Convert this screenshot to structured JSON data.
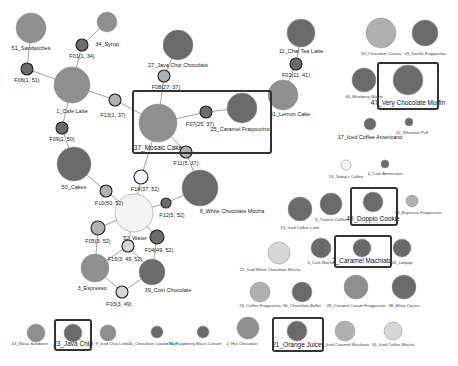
{
  "diagram": {
    "type": "item-association-network",
    "colors": {
      "dark": "#6b6b6b",
      "mid": "#8f8f8f",
      "light": "#b0b0b0",
      "pale": "#d6d6d6",
      "white": "#f4f4f4",
      "edge": "#8a8a8a",
      "highlight_border": "#333333"
    },
    "items": [
      {
        "id": "51",
        "label": "51_Sandwiches",
        "x": 31,
        "y": 28,
        "r": 15,
        "fill": "mid",
        "lx": 31,
        "ly": 50,
        "cls": "lbl"
      },
      {
        "id": "34",
        "label": "34_Syrup",
        "x": 107,
        "y": 22,
        "r": 10,
        "fill": "mid",
        "lx": 107,
        "ly": 46,
        "cls": "lbl"
      },
      {
        "id": "1",
        "label": "1_Cafe Latte",
        "x": 72,
        "y": 85,
        "r": 18,
        "fill": "mid",
        "lx": 72,
        "ly": 113,
        "cls": "lbl"
      },
      {
        "id": "27",
        "label": "27_Java Chip Chocolate",
        "x": 178,
        "y": 45,
        "r": 15,
        "fill": "dark",
        "lx": 178,
        "ly": 67,
        "cls": "lbl"
      },
      {
        "id": "11",
        "label": "11_Chai Tea Latte",
        "x": 301,
        "y": 33,
        "r": 14,
        "fill": "dark",
        "lx": 301,
        "ly": 53,
        "cls": "lbl"
      },
      {
        "id": "41",
        "label": "41_Lemon Cake",
        "x": 283,
        "y": 95,
        "r": 15,
        "fill": "mid",
        "lx": 290,
        "ly": 116,
        "cls": "lbl"
      },
      {
        "id": "37",
        "label": "37_Mosaic Cake",
        "x": 158,
        "y": 123,
        "r": 19,
        "fill": "mid",
        "lx": 158,
        "ly": 150,
        "cls": "lbl-hl"
      },
      {
        "id": "25",
        "label": "25_Caramel Frappucino",
        "x": 242,
        "y": 108,
        "r": 15,
        "fill": "dark",
        "lx": 240,
        "ly": 131,
        "cls": "lbl"
      },
      {
        "id": "50",
        "label": "50_Cakes",
        "x": 74,
        "y": 164,
        "r": 17,
        "fill": "dark",
        "lx": 74,
        "ly": 189,
        "cls": "lbl"
      },
      {
        "id": "6",
        "label": "6_White Chocolate Mocha",
        "x": 200,
        "y": 188,
        "r": 18,
        "fill": "dark",
        "lx": 232,
        "ly": 213,
        "cls": "lbl"
      },
      {
        "id": "52",
        "label": "52_Water",
        "x": 134,
        "y": 213,
        "r": 19,
        "fill": "white",
        "lx": 135,
        "ly": 240,
        "cls": "lbl"
      },
      {
        "id": "3",
        "label": "3_Espresso",
        "x": 95,
        "y": 268,
        "r": 14,
        "fill": "mid",
        "lx": 92,
        "ly": 290,
        "cls": "lbl"
      },
      {
        "id": "39",
        "label": "39_Coin Chocolate",
        "x": 152,
        "y": 272,
        "r": 13,
        "fill": "dark",
        "lx": 168,
        "ly": 292,
        "cls": "lbl"
      },
      {
        "id": "35",
        "label": "35_Chocolate Cosica",
        "x": 381,
        "y": 33,
        "r": 15,
        "fill": "light",
        "lx": 381,
        "ly": 55,
        "cls": "lbl-sm"
      },
      {
        "id": "29",
        "label": "29_Vanilla Frappucino",
        "x": 425,
        "y": 33,
        "r": 13,
        "fill": "dark",
        "lx": 425,
        "ly": 55,
        "cls": "lbl-sm"
      },
      {
        "id": "46",
        "label": "46_Blueberry Muffin",
        "x": 364,
        "y": 80,
        "r": 12,
        "fill": "dark",
        "lx": 364,
        "ly": 98,
        "cls": "lbl-sm"
      },
      {
        "id": "47",
        "label": "47_Very Chocolate Muffin",
        "x": 408,
        "y": 80,
        "r": 15,
        "fill": "dark",
        "lx": 408,
        "ly": 105,
        "cls": "lbl-hl"
      },
      {
        "id": "17",
        "label": "17_Iced Coffee Americano",
        "x": 370,
        "y": 124,
        "r": 6,
        "fill": "dark",
        "lx": 370,
        "ly": 139,
        "cls": "lbl"
      },
      {
        "id": "42",
        "label": "42_Wheaten Puff",
        "x": 409,
        "y": 122,
        "r": 4,
        "fill": "dark",
        "lx": 412,
        "ly": 134,
        "cls": "lbl-sm"
      },
      {
        "id": "13",
        "label": "13_Today's Coffee",
        "x": 346,
        "y": 165,
        "r": 5,
        "fill": "white",
        "lx": 346,
        "ly": 178,
        "cls": "lbl-sm"
      },
      {
        "id": "4",
        "label": "4_Cafe Americano",
        "x": 385,
        "y": 164,
        "r": 4,
        "fill": "dark",
        "lx": 385,
        "ly": 175,
        "cls": "lbl-sm"
      },
      {
        "id": "15",
        "label": "15_Iced Coffee Latte",
        "x": 300,
        "y": 209,
        "r": 12,
        "fill": "dark",
        "lx": 300,
        "ly": 229,
        "cls": "lbl-sm"
      },
      {
        "id": "8",
        "label": "8_Turkish Coffee",
        "x": 331,
        "y": 204,
        "r": 11,
        "fill": "dark",
        "lx": 331,
        "ly": 221,
        "cls": "lbl-sm"
      },
      {
        "id": "40",
        "label": "40_Doppio Cookie",
        "x": 373,
        "y": 202,
        "r": 10,
        "fill": "dark",
        "lx": 373,
        "ly": 221,
        "cls": "lbl-hl"
      },
      {
        "id": "24",
        "label": "24_Espresso Frappucino",
        "x": 412,
        "y": 201,
        "r": 6,
        "fill": "light",
        "lx": 418,
        "ly": 214,
        "cls": "lbl-sm"
      },
      {
        "id": "22",
        "label": "22_Iced White Chocolate Mocha",
        "x": 279,
        "y": 253,
        "r": 11,
        "fill": "pale",
        "lx": 270,
        "ly": 271,
        "cls": "lbl-sm"
      },
      {
        "id": "6b",
        "label": "6_Cafe Mocha",
        "x": 321,
        "y": 248,
        "r": 10,
        "fill": "dark",
        "lx": 321,
        "ly": 264,
        "cls": "lbl-sm"
      },
      {
        "id": "7",
        "label": "7_Caramel Machiato",
        "x": 362,
        "y": 248,
        "r": 9,
        "fill": "dark",
        "lx": 362,
        "ly": 263,
        "cls": "lbl-hl"
      },
      {
        "id": "45",
        "label": "45_Lolipop",
        "x": 402,
        "y": 248,
        "r": 9,
        "fill": "dark",
        "lx": 402,
        "ly": 264,
        "cls": "lbl-sm"
      },
      {
        "id": "26",
        "label": "26_Coffee Frappucino",
        "x": 260,
        "y": 292,
        "r": 10,
        "fill": "light",
        "lx": 260,
        "ly": 307,
        "cls": "lbl-sm"
      },
      {
        "id": "36",
        "label": "36_Chocolate Bellini",
        "x": 302,
        "y": 292,
        "r": 10,
        "fill": "dark",
        "lx": 302,
        "ly": 307,
        "cls": "lbl-sm"
      },
      {
        "id": "28",
        "label": "28_Caramel Cream Frappucino",
        "x": 356,
        "y": 287,
        "r": 12,
        "fill": "mid",
        "lx": 356,
        "ly": 307,
        "cls": "lbl-sm"
      },
      {
        "id": "38",
        "label": "38_Misto Cocios",
        "x": 404,
        "y": 287,
        "r": 12,
        "fill": "dark",
        "lx": 404,
        "ly": 307,
        "cls": "lbl-sm"
      },
      {
        "id": "43",
        "label": "43_Wasa Sandwich",
        "x": 36,
        "y": 333,
        "r": 9,
        "fill": "mid",
        "lx": 30,
        "ly": 345,
        "cls": "lbl-sm"
      },
      {
        "id": "23",
        "label": "23_Java Chip",
        "x": 73,
        "y": 333,
        "r": 9,
        "fill": "dark",
        "lx": 73,
        "ly": 346,
        "cls": "lbl-hl"
      },
      {
        "id": "9",
        "label": "9_Iced Chai Latte",
        "x": 108,
        "y": 333,
        "r": 8,
        "fill": "mid",
        "lx": 112,
        "ly": 345,
        "cls": "lbl-sm"
      },
      {
        "id": "44",
        "label": "44_Chocolate Coated Nut",
        "x": 157,
        "y": 332,
        "r": 6,
        "fill": "dark",
        "lx": 152,
        "ly": 345,
        "cls": "lbl-sm"
      },
      {
        "id": "31",
        "label": "31_Raspberry Black Currant",
        "x": 203,
        "y": 332,
        "r": 6,
        "fill": "dark",
        "lx": 195,
        "ly": 345,
        "cls": "lbl-sm"
      },
      {
        "id": "2",
        "label": "2_Hot Chocolate",
        "x": 248,
        "y": 328,
        "r": 11,
        "fill": "mid",
        "lx": 242,
        "ly": 345,
        "cls": "lbl-sm"
      },
      {
        "id": "21",
        "label": "21_Orange Juice",
        "x": 297,
        "y": 331,
        "r": 10,
        "fill": "dark",
        "lx": 297,
        "ly": 347,
        "cls": "lbl-hl"
      },
      {
        "id": "5",
        "label": "5_Iced Caramel Machiato",
        "x": 345,
        "y": 331,
        "r": 10,
        "fill": "light",
        "lx": 345,
        "ly": 346,
        "cls": "lbl-sm"
      },
      {
        "id": "16",
        "label": "16_Iced Coffee Mocha",
        "x": 393,
        "y": 331,
        "r": 9,
        "fill": "pale",
        "lx": 393,
        "ly": 346,
        "cls": "lbl-sm"
      }
    ],
    "factors": [
      {
        "label": "F06(1, 51)",
        "x": 27,
        "y": 69,
        "r": 6,
        "fill": "dark",
        "lx": 27,
        "ly": 82
      },
      {
        "label": "F01(1, 34)",
        "x": 82,
        "y": 45,
        "r": 6,
        "fill": "dark",
        "lx": 82,
        "ly": 58
      },
      {
        "label": "F13(1, 37)",
        "x": 115,
        "y": 100,
        "r": 6,
        "fill": "light",
        "lx": 113,
        "ly": 117
      },
      {
        "label": "F09(1, 50)",
        "x": 62,
        "y": 128,
        "r": 6,
        "fill": "dark",
        "lx": 62,
        "ly": 141
      },
      {
        "label": "F08(27, 37)",
        "x": 164,
        "y": 76,
        "r": 6,
        "fill": "light",
        "lx": 166,
        "ly": 89
      },
      {
        "label": "F02(11, 41)",
        "x": 296,
        "y": 64,
        "r": 6,
        "fill": "dark",
        "lx": 296,
        "ly": 77
      },
      {
        "label": "F07(25, 37)",
        "x": 206,
        "y": 112,
        "r": 6,
        "fill": "dark",
        "lx": 200,
        "ly": 126
      },
      {
        "label": "F11(5, 37)",
        "x": 186,
        "y": 152,
        "r": 6,
        "fill": "light",
        "lx": 186,
        "ly": 165
      },
      {
        "label": "F14(37, 52)",
        "x": 141,
        "y": 177,
        "r": 7,
        "fill": "white",
        "lx": 145,
        "ly": 191
      },
      {
        "label": "F10(50, 52)",
        "x": 106,
        "y": 191,
        "r": 6,
        "fill": "light",
        "lx": 109,
        "ly": 205
      },
      {
        "label": "F12(5, 52)",
        "x": 166,
        "y": 203,
        "r": 5,
        "fill": "dark",
        "lx": 172,
        "ly": 217
      },
      {
        "label": "F05(3, 52)",
        "x": 98,
        "y": 228,
        "r": 7,
        "fill": "light",
        "lx": 98,
        "ly": 243
      },
      {
        "label": "F04(49, 52)",
        "x": 157,
        "y": 237,
        "r": 7,
        "fill": "dark",
        "lx": 159,
        "ly": 252
      },
      {
        "label": "F15(3, 49, 52)",
        "x": 128,
        "y": 246,
        "r": 6,
        "fill": "pale",
        "lx": 125,
        "ly": 261
      },
      {
        "label": "F03(3, 49)",
        "x": 122,
        "y": 292,
        "r": 6,
        "fill": "pale",
        "lx": 119,
        "ly": 306
      }
    ],
    "edges": [
      [
        31,
        28,
        27,
        69
      ],
      [
        27,
        69,
        72,
        85
      ],
      [
        107,
        22,
        82,
        45
      ],
      [
        82,
        45,
        72,
        85
      ],
      [
        72,
        85,
        115,
        100
      ],
      [
        115,
        100,
        158,
        123
      ],
      [
        72,
        85,
        62,
        128
      ],
      [
        62,
        128,
        74,
        164
      ],
      [
        178,
        45,
        164,
        76
      ],
      [
        164,
        76,
        158,
        123
      ],
      [
        301,
        33,
        296,
        64
      ],
      [
        296,
        64,
        283,
        95
      ],
      [
        242,
        108,
        206,
        112
      ],
      [
        206,
        112,
        158,
        123
      ],
      [
        158,
        123,
        186,
        152
      ],
      [
        186,
        152,
        200,
        188
      ],
      [
        158,
        123,
        141,
        177
      ],
      [
        141,
        177,
        134,
        213
      ],
      [
        74,
        164,
        106,
        191
      ],
      [
        106,
        191,
        134,
        213
      ],
      [
        200,
        188,
        166,
        203
      ],
      [
        166,
        203,
        134,
        213
      ],
      [
        134,
        213,
        98,
        228
      ],
      [
        98,
        228,
        95,
        268
      ],
      [
        134,
        213,
        157,
        237
      ],
      [
        157,
        237,
        152,
        272
      ],
      [
        134,
        213,
        128,
        246
      ],
      [
        128,
        246,
        95,
        268
      ],
      [
        128,
        246,
        152,
        272
      ],
      [
        95,
        268,
        122,
        292
      ],
      [
        122,
        292,
        152,
        272
      ]
    ],
    "highlight_boxes": [
      {
        "name": "highlight-mosaic-cake",
        "x": 133,
        "y": 91,
        "w": 138,
        "h": 62
      },
      {
        "name": "highlight-very-chocolate-muffin",
        "x": 378,
        "y": 63,
        "w": 60,
        "h": 46
      },
      {
        "name": "highlight-doppio-cookie",
        "x": 351,
        "y": 188,
        "w": 46,
        "h": 37
      },
      {
        "name": "highlight-caramel-machiato",
        "x": 335,
        "y": 236,
        "w": 56,
        "h": 31
      },
      {
        "name": "highlight-java-chip",
        "x": 55,
        "y": 320,
        "w": 36,
        "h": 30
      },
      {
        "name": "highlight-orange-juice",
        "x": 273,
        "y": 318,
        "w": 50,
        "h": 33
      }
    ]
  }
}
